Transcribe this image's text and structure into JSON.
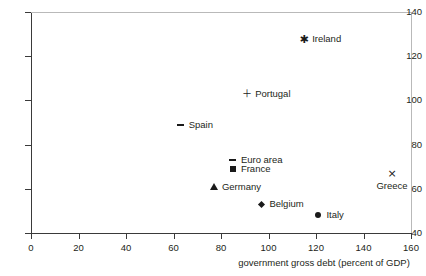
{
  "chart_data": {
    "type": "scatter",
    "title": "",
    "xlabel": "government gross debt (percent of GDP)",
    "ylabel": "",
    "xlim": [
      0,
      160
    ],
    "ylim": [
      40,
      140
    ],
    "xticks": [
      "0",
      "20",
      "40",
      "60",
      "80",
      "100",
      "120",
      "140",
      "160"
    ],
    "yticks": [
      "40",
      "60",
      "80",
      "100",
      "120",
      "140"
    ],
    "grid": false,
    "legend": "none (points labeled in-place)",
    "points": [
      {
        "label": "Ireland",
        "x": 115,
        "y": 128,
        "marker": "asterisk-marker",
        "label_pos": "right"
      },
      {
        "label": "Portugal",
        "x": 91,
        "y": 103,
        "marker": "plus-marker",
        "label_pos": "right"
      },
      {
        "label": "Spain",
        "x": 63,
        "y": 89,
        "marker": "dash-marker",
        "label_pos": "right"
      },
      {
        "label": "Euro area",
        "x": 85,
        "y": 73,
        "marker": "dash-marker",
        "label_pos": "right"
      },
      {
        "label": "France",
        "x": 85,
        "y": 69,
        "marker": "square-marker",
        "label_pos": "right"
      },
      {
        "label": "Germany",
        "x": 77,
        "y": 61,
        "marker": "triangle-marker",
        "label_pos": "right"
      },
      {
        "label": "Greece",
        "x": 152,
        "y": 67,
        "marker": "cross-marker",
        "label_pos": "below"
      },
      {
        "label": "Belgium",
        "x": 97,
        "y": 53,
        "marker": "diamond-marker",
        "label_pos": "right"
      },
      {
        "label": "Italy",
        "x": 121,
        "y": 48,
        "marker": "circle-marker",
        "label_pos": "right"
      }
    ]
  },
  "colors": {
    "marker": "#1a1a1a",
    "axis": "#3a3a3a",
    "frame": "#b9b9b9",
    "text": "#231f20",
    "background": "#ffffff"
  }
}
